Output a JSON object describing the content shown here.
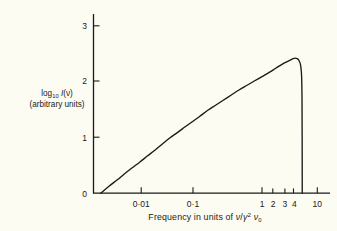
{
  "figure": {
    "background_color": "#fcfcf2",
    "ink_color": "#1a1a18"
  },
  "axes": {
    "y_label_line1_pre": "log",
    "y_label_line1_sub": "10",
    "y_label_line1_fn": "I",
    "y_label_line1_arg": "(ν)",
    "y_label_line2": "(arbitrary units)",
    "x_caption_pre": "Frequency in units of ",
    "x_caption_sym1": "ν",
    "x_caption_slash": "/",
    "x_caption_sym2": "γ",
    "x_caption_pow": "2",
    "x_caption_sym3": "ν",
    "x_caption_sub": "0",
    "x_tick_labels": [
      "0·01",
      "0·1",
      "1",
      "2",
      "3",
      "4",
      "10"
    ],
    "y_tick_labels": [
      "0",
      "1",
      "2",
      "3"
    ]
  },
  "chart_data": {
    "type": "line",
    "title": "",
    "xlabel": "Frequency in units of ν/γ²ν₀",
    "ylabel": "log10 I(ν) (arbitrary units)",
    "x_scale": "log",
    "y_scale": "linear",
    "xlim": [
      0.0023,
      10
    ],
    "ylim": [
      0,
      3.35
    ],
    "x_ticks": [
      0.01,
      0.1,
      1,
      2,
      3,
      4,
      10
    ],
    "x_tick_labels": [
      "0·01",
      "0·1",
      "1",
      "2",
      "3",
      "4",
      "10"
    ],
    "y_ticks": [
      0,
      1,
      2,
      3
    ],
    "y_tick_labels": [
      "0",
      "1",
      "2",
      "3"
    ],
    "grid": false,
    "legend": false,
    "series": [
      {
        "name": "synchrotron spectrum",
        "color": "#1a1a18",
        "x": [
          0.0046,
          0.006,
          0.008,
          0.01,
          0.013,
          0.017,
          0.022,
          0.028,
          0.036,
          0.046,
          0.06,
          0.077,
          0.1,
          0.129,
          0.166,
          0.215,
          0.278,
          0.359,
          0.464,
          0.599,
          0.774,
          1.0,
          1.292,
          1.585,
          1.95,
          2.239,
          2.512,
          2.818,
          3.02,
          3.236,
          3.388,
          3.548,
          3.631,
          3.715,
          3.76,
          3.8,
          3.82,
          3.83
        ],
        "y": [
          0.0,
          0.12,
          0.24,
          0.34,
          0.45,
          0.56,
          0.67,
          0.77,
          0.88,
          0.99,
          1.09,
          1.19,
          1.29,
          1.39,
          1.49,
          1.58,
          1.67,
          1.76,
          1.85,
          1.93,
          2.01,
          2.09,
          2.17,
          2.24,
          2.31,
          2.35,
          2.38,
          2.41,
          2.42,
          2.41,
          2.39,
          2.34,
          2.29,
          2.18,
          2.05,
          1.7,
          1.0,
          0.0
        ],
        "peak_x": 3.02,
        "peak_y": 2.42,
        "cutoff_x": 3.83
      }
    ]
  }
}
